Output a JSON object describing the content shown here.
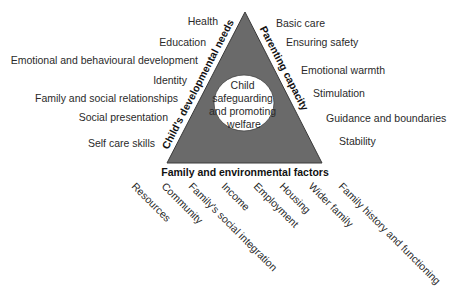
{
  "diagram": {
    "colors": {
      "triangle_fill": "#6a6a6a",
      "triangle_stroke": "#3a3a3a",
      "circle_fill": "#ffffff",
      "text": "#2a2a2a"
    },
    "center": {
      "lines": [
        "Child",
        "safeguarding",
        "and promoting",
        "welfare"
      ]
    },
    "sides": {
      "left": "Child's developmental needs",
      "right": "Parenting capacity",
      "bottom": "Family and environmental factors"
    },
    "left_items": [
      "Health",
      "Education",
      "Emotional and behavioural development",
      "Identity",
      "Family and social relationships",
      "Social presentation",
      "Self care skills"
    ],
    "right_items": [
      "Basic care",
      "Ensuring safety",
      "Emotional warmth",
      "Stimulation",
      "Guidance and boundaries",
      "Stability"
    ],
    "bottom_items": [
      "Resources",
      "Community",
      "Family's social integration",
      "Income",
      "Employment",
      "Housing",
      "Wider family",
      "Family history and functioning"
    ]
  }
}
